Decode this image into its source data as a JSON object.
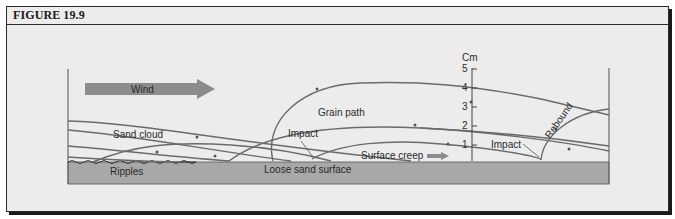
{
  "figure": {
    "title": "FIGURE 19.9"
  },
  "diagram": {
    "wind_label": "Wind",
    "labels": {
      "sand_cloud": "Sand cloud",
      "ripples": "Ripples",
      "grain_path": "Grain path",
      "impact_left": "Impact",
      "impact_right": "Impact",
      "loose_sand_surface": "Loose sand surface",
      "surface_creep": "Surface creep",
      "rebound": "Rebound"
    },
    "scale": {
      "unit": "Cm",
      "ticks": [
        "5",
        "4",
        "3",
        "2",
        "1"
      ]
    },
    "colors": {
      "background": "#ececec",
      "sand": "#a8a8a8",
      "wind_arrow": "#8c8c8c",
      "lines": "#6a6a6a",
      "border": "#2a2a2a"
    }
  }
}
